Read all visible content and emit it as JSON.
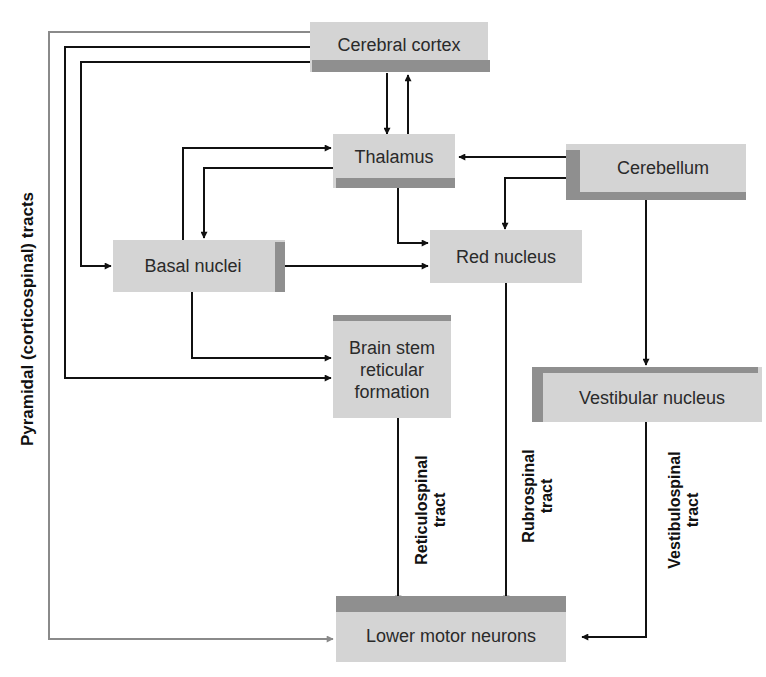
{
  "diagram": {
    "nodes": {
      "cerebral_cortex": "Cerebral cortex",
      "thalamus": "Thalamus",
      "cerebellum": "Cerebellum",
      "basal_nuclei": "Basal nuclei",
      "red_nucleus": "Red nucleus",
      "brain_stem_line1": "Brain stem",
      "brain_stem_line2": "reticular",
      "brain_stem_line3": "formation",
      "vestibular_nucleus": "Vestibular nucleus",
      "lower_motor_neurons": "Lower motor neurons"
    },
    "tracts": {
      "pyramidal": "Pyramidal (corticospinal) tracts",
      "reticulospinal_line1": "Reticulospinal",
      "reticulospinal_line2": "tract",
      "rubrospinal_line1": "Rubrospinal",
      "rubrospinal_line2": "tract",
      "vestibulospinal_line1": "Vestibulospinal",
      "vestibulospinal_line2": "tract"
    },
    "edges": [
      {
        "from": "Cerebral cortex",
        "to": "Thalamus"
      },
      {
        "from": "Thalamus",
        "to": "Cerebral cortex"
      },
      {
        "from": "Cerebral cortex",
        "to": "Basal nuclei"
      },
      {
        "from": "Cerebral cortex",
        "to": "Brain stem reticular formation"
      },
      {
        "from": "Cerebral cortex",
        "to": "Lower motor neurons",
        "label": "Pyramidal (corticospinal) tracts"
      },
      {
        "from": "Basal nuclei",
        "to": "Thalamus"
      },
      {
        "from": "Thalamus",
        "to": "Basal nuclei"
      },
      {
        "from": "Cerebellum",
        "to": "Thalamus"
      },
      {
        "from": "Cerebellum",
        "to": "Red nucleus"
      },
      {
        "from": "Thalamus",
        "to": "Red nucleus"
      },
      {
        "from": "Basal nuclei",
        "to": "Red nucleus"
      },
      {
        "from": "Basal nuclei",
        "to": "Brain stem reticular formation"
      },
      {
        "from": "Cerebellum",
        "to": "Vestibular nucleus"
      },
      {
        "from": "Brain stem reticular formation",
        "to": "Lower motor neurons",
        "label": "Reticulospinal tract"
      },
      {
        "from": "Red nucleus",
        "to": "Lower motor neurons",
        "label": "Rubrospinal tract"
      },
      {
        "from": "Vestibular nucleus",
        "to": "Lower motor neurons",
        "label": "Vestibulospinal tract"
      }
    ],
    "colors": {
      "box_face": "#d4d4d4",
      "box_shade": "#8f8f8f",
      "line": "#111111",
      "pyramidal_line": "#8a8a8a"
    }
  }
}
